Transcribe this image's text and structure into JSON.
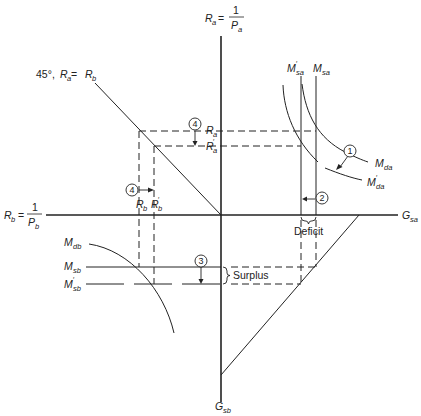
{
  "diagram": {
    "type": "four-quadrant exchange rate / monetary equilibrium diagram",
    "axes": {
      "top": {
        "main": "R",
        "sub": "a",
        "eq": "=",
        "num": "1",
        "den_main": "P",
        "den_sub": "a"
      },
      "left": {
        "main": "R",
        "sub": "b",
        "eq": "=",
        "num": "1",
        "den_main": "P",
        "den_sub": "b"
      },
      "right": {
        "main": "G",
        "sub": "sa"
      },
      "bottom": {
        "main": "G",
        "sub": "sb"
      }
    },
    "line_45": {
      "prefix": "45°, ",
      "ra_main": "R",
      "ra_sub": "a",
      "eq": " = ",
      "rb_main": "R",
      "rb_sub": "b"
    },
    "labels": {
      "ra": {
        "main": "R",
        "sub": "a"
      },
      "ra_prime": {
        "main": "R",
        "prime": "′",
        "sub": "a"
      },
      "rb": {
        "main": "R",
        "sub": "b"
      },
      "rb_prime": {
        "main": "R",
        "prime": "′",
        "sub": "b"
      },
      "msa": {
        "main": "M",
        "sub": "sa"
      },
      "msa_prime": {
        "main": "M",
        "prime": "′",
        "sub": "sa"
      },
      "mda": {
        "main": "M",
        "sub": "da"
      },
      "mda_prime": {
        "main": "M",
        "prime": "′",
        "sub": "da"
      },
      "mdb": {
        "main": "M",
        "sub": "db"
      },
      "msb": {
        "main": "M",
        "sub": "sb"
      },
      "msb_prime": {
        "main": "M",
        "prime": "′",
        "sub": "sb"
      },
      "deficit": "Deficit",
      "surplus": "Surplus"
    },
    "steps": [
      "1",
      "2",
      "3",
      "4",
      "4"
    ]
  }
}
